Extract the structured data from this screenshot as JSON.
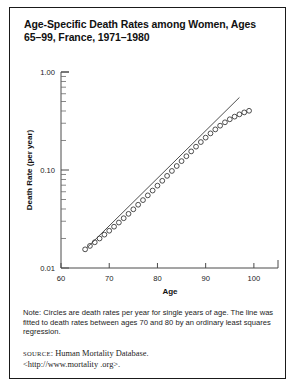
{
  "figure": {
    "title": "Age-Specific Death Rates among Women, Ages 65–99, France, 1971–1980",
    "note": "Note: Circles are death rates per year for single years of age. The line was fitted to death rates between ages 70 and 80 by an ordinary least squares regression.",
    "source_label": "SOURCE",
    "source_text": ": Human Mortality Database.",
    "source_url": "<http://www.mortality .org>."
  },
  "chart_data": {
    "type": "scatter",
    "title": "Age-Specific Death Rates among Women, Ages 65–99, France, 1971–1980",
    "xlabel": "Age",
    "ylabel": "Death Rate (per year)",
    "xlim": [
      60,
      105
    ],
    "ylim": [
      0.01,
      1.0
    ],
    "yscale": "log",
    "grid": false,
    "legend": null,
    "xticks": [
      60,
      70,
      80,
      90,
      100
    ],
    "xtick_labels": [
      "60",
      "70",
      "80",
      "90",
      "100"
    ],
    "yticks": [
      0.01,
      0.1,
      1.0
    ],
    "ytick_labels": [
      "0.01",
      "0.10",
      "1.00"
    ],
    "series": [
      {
        "name": "Death rate per year, single years of age",
        "marker": "open-circle",
        "x": [
          65,
          66,
          67,
          68,
          69,
          70,
          71,
          72,
          73,
          74,
          75,
          76,
          77,
          78,
          79,
          80,
          81,
          82,
          83,
          84,
          85,
          86,
          87,
          88,
          89,
          90,
          91,
          92,
          93,
          94,
          95,
          96,
          97,
          98,
          99
        ],
        "values": [
          0.0155,
          0.0168,
          0.0183,
          0.02,
          0.0219,
          0.024,
          0.0264,
          0.0291,
          0.0322,
          0.0357,
          0.0397,
          0.0442,
          0.0493,
          0.0551,
          0.0617,
          0.0692,
          0.0776,
          0.0871,
          0.0978,
          0.1098,
          0.1232,
          0.1382,
          0.1548,
          0.173,
          0.1928,
          0.214,
          0.2364,
          0.2596,
          0.2832,
          0.3066,
          0.3292,
          0.3504,
          0.3698,
          0.387,
          0.402
        ]
      },
      {
        "name": "OLS fitted line (ages 70–80)",
        "type": "line",
        "x": [
          65.5,
          97.0
        ],
        "values": [
          0.0163,
          0.55
        ]
      }
    ]
  }
}
